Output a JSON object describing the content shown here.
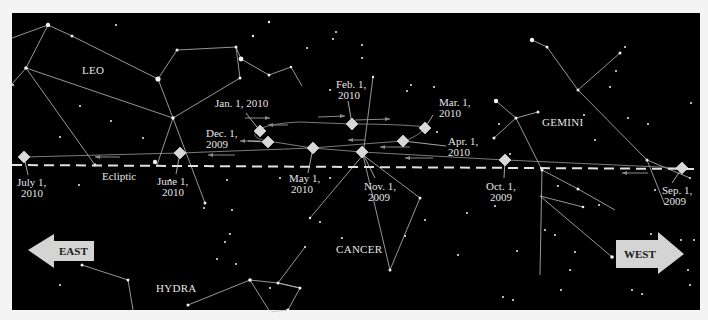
{
  "constellations": [
    "LEO",
    "GEMINI",
    "CANCER",
    "HYDRA"
  ],
  "ecliptic_label": "Ecliptic",
  "directions": {
    "east": "EAST",
    "west": "WEST"
  },
  "mars_positions": [
    {
      "line1": "Sep. 1,",
      "line2": "2009"
    },
    {
      "line1": "Oct. 1,",
      "line2": "2009"
    },
    {
      "line1": "Nov. 1,",
      "line2": "2009"
    },
    {
      "line1": "Dec. 1,",
      "line2": "2009"
    },
    {
      "line1": "Jan. 1, 2010",
      "line2": ""
    },
    {
      "line1": "Feb. 1,",
      "line2": "2010"
    },
    {
      "line1": "Mar. 1,",
      "line2": "2010"
    },
    {
      "line1": "Apr. 1,",
      "line2": "2010"
    },
    {
      "line1": "May 1,",
      "line2": "2010"
    },
    {
      "line1": "June 1,",
      "line2": "2010"
    },
    {
      "line1": "July 1,",
      "line2": "2010"
    }
  ],
  "colors": {
    "sky": "#000000",
    "marker": "#d9d9d9",
    "line": "#cfcfcf",
    "arrow": "#d4d4d4"
  }
}
